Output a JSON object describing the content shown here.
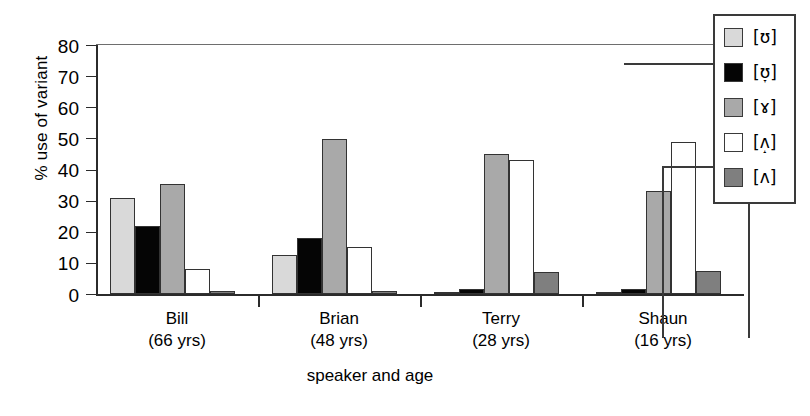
{
  "chart_data": {
    "type": "bar",
    "title": "",
    "xlabel": "speaker and age",
    "ylabel": "% use of variant",
    "ylim": [
      0,
      80
    ],
    "yticks": [
      0,
      10,
      20,
      30,
      40,
      50,
      60,
      70,
      80
    ],
    "grid": false,
    "legend_position": "top-right",
    "categories": [
      "Bill\n(66 yrs)",
      "Brian\n(48 yrs)",
      "Terry\n(28 yrs)",
      "Shaun\n(16 yrs)"
    ],
    "category_names": [
      "Bill",
      "Brian",
      "Terry",
      "Shaun"
    ],
    "category_ages": [
      "(66 yrs)",
      "(48 yrs)",
      "(28 yrs)",
      "(16 yrs)"
    ],
    "series": [
      {
        "name": "[ʊ]",
        "base": "[ʊ]",
        "diacritic": "",
        "color": "#d9d9d9",
        "values": [
          31,
          12.5,
          0.7,
          0.7
        ]
      },
      {
        "name": "[ʊ̞]",
        "base": "[ʊ]",
        "diacritic": "˕",
        "color": "#050505",
        "values": [
          21.8,
          18,
          1.5,
          1.5
        ]
      },
      {
        "name": "[ɤ]",
        "base": "[ɤ]",
        "diacritic": "",
        "color": "#a9a9a9",
        "values": [
          35.5,
          49.8,
          45,
          33
        ]
      },
      {
        "name": "[ʌ̝]",
        "base": "[ʌ]",
        "diacritic": "˔",
        "color": "#ffffff",
        "values": [
          8,
          15,
          43,
          48.8
        ]
      },
      {
        "name": "[ʌ]",
        "base": "[ʌ]",
        "diacritic": "",
        "color": "#7f7f7f",
        "values": [
          1,
          1,
          7,
          7.5
        ]
      }
    ]
  },
  "legend": {
    "entries": [
      {
        "label": "[ʊ]",
        "base": "[ʊ]",
        "diacritic": "",
        "color": "#d9d9d9"
      },
      {
        "label": "[ʊ̞]",
        "base": "[ʊ]",
        "diacritic": "˕",
        "color": "#050505"
      },
      {
        "label": "[ɤ]",
        "base": "[ɤ]",
        "diacritic": "",
        "color": "#a9a9a9"
      },
      {
        "label": "[ʌ̝]",
        "base": "[ʌ]",
        "diacritic": "˔",
        "color": "#ffffff"
      },
      {
        "label": "[ʌ]",
        "base": "[ʌ]",
        "diacritic": "",
        "color": "#7f7f7f"
      }
    ]
  },
  "axes": {
    "y_title": "% use of variant",
    "x_title": "speaker and age",
    "y_tick_labels": [
      "80",
      "70",
      "60",
      "50",
      "40",
      "30",
      "20",
      "10",
      "0"
    ]
  }
}
